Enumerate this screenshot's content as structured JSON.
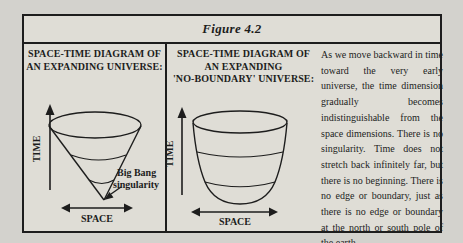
{
  "figure_title": "Figure 4.2",
  "left_panel": {
    "heading": [
      "SPACE-TIME DIAGRAM OF",
      "AN EXPANDING UNIVERSE:"
    ],
    "time_axis_label": "TIME",
    "space_axis_label": "SPACE",
    "singularity_label_line1": "Big Bang",
    "singularity_label_line2": "singularity"
  },
  "middle_panel": {
    "heading": [
      "SPACE-TIME DIAGRAM OF",
      "AN EXPANDING",
      "'NO-BOUNDARY' UNIVERSE:"
    ],
    "time_axis_label": "TIME",
    "space_axis_label": "SPACE"
  },
  "description_text": "As we move backward in time toward the very early universe, the time dimension gradually becomes indistinguishable from the space dimensions. There is no singularity. Time does not stretch back infinitely far, but there is no beginning. There is no edge or boundary, just as there is no edge or boundary at the north or south pole of the earth",
  "colors": {
    "paper": "#d3d2cd",
    "box-bg": "#dfddd6",
    "ink": "#1d1d1d"
  }
}
